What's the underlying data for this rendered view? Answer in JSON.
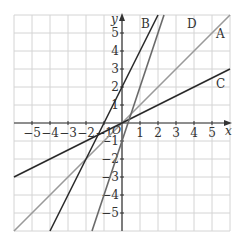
{
  "chart_data": {
    "type": "line",
    "title": "",
    "xlabel": "x",
    "ylabel": "y",
    "origin_label": "O",
    "xlim": [
      -6,
      6
    ],
    "ylim": [
      -6,
      6
    ],
    "grid": true,
    "x_ticks": [
      -5,
      -4,
      -3,
      -2,
      -1,
      1,
      2,
      3,
      4,
      5
    ],
    "y_ticks": [
      -5,
      -4,
      -3,
      -2,
      -1,
      1,
      2,
      3,
      4,
      5
    ],
    "x_tick_labels": [
      "−5",
      "−4",
      "−3",
      "−2",
      "−1",
      "1",
      "2",
      "3",
      "4",
      "5"
    ],
    "y_tick_labels": [
      "−5",
      "−4",
      "−3",
      "−2",
      "−1",
      "1",
      "2",
      "3",
      "4",
      "5"
    ],
    "series": [
      {
        "name": "A",
        "equation": "y = x",
        "slope": 1,
        "intercept": 0,
        "color": "#9a9a9a"
      },
      {
        "name": "B",
        "equation": "y = 2x + 2",
        "slope": 2,
        "intercept": 2,
        "color": "#2a2a2a"
      },
      {
        "name": "C",
        "equation": "y = 0.5x",
        "slope": 0.5,
        "intercept": 0,
        "color": "#2a2a2a"
      },
      {
        "name": "D",
        "equation": "y = 3x - 1",
        "slope": 3,
        "intercept": -1,
        "color": "#6a6a6a"
      }
    ]
  },
  "labels": {
    "A": "A",
    "B": "B",
    "C": "C",
    "D": "D"
  }
}
